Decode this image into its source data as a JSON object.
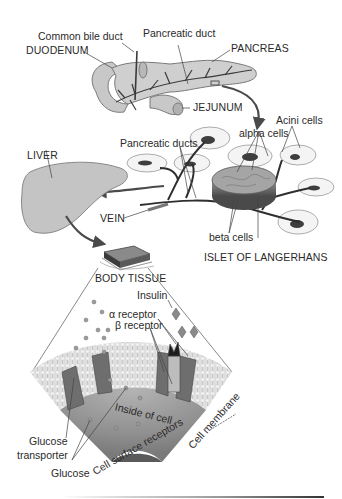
{
  "diagram": {
    "palette": {
      "background": "#ffffff",
      "organ_fill": "#c8c8c8",
      "organ_stroke": "#7a7a7a",
      "duct": "#3a3a3a",
      "arrow": "#4a4a4a",
      "text": "#2a2a2a",
      "cell_interior": "#9a9a9a",
      "membrane": "#d9d9d9",
      "receptor": "#6e6e6e",
      "nucleus": "#5a5a5a"
    },
    "labels": {
      "common_bile_duct": "Common bile duct",
      "pancreatic_duct": "Pancreatic duct",
      "duodenum": "DUODENUM",
      "pancreas": "PANCREAS",
      "jejunum": "JEJUNUM",
      "acini_cells": "Acini cells",
      "pancreatic_ducts": "Pancreatic ducts",
      "alpha_cells": "alpha cells",
      "liver": "LIVER",
      "vein": "VEIN",
      "beta_cells": "beta cells",
      "islet_of_langerhans": "ISLET OF LANGERHANS",
      "body_tissue": "BODY TISSUE",
      "insulin": "Insulin",
      "alpha_receptor": "α receptor",
      "beta_receptor": "β receptor",
      "inside_of_cell": "Inside of cell",
      "cell_membrane": "Cell membrane",
      "glucose_transporter_line1": "Glucose",
      "glucose_transporter_line2": "transporter",
      "glucose": "Glucose",
      "cell_surface_receptors": "Cell surface receptors"
    }
  }
}
